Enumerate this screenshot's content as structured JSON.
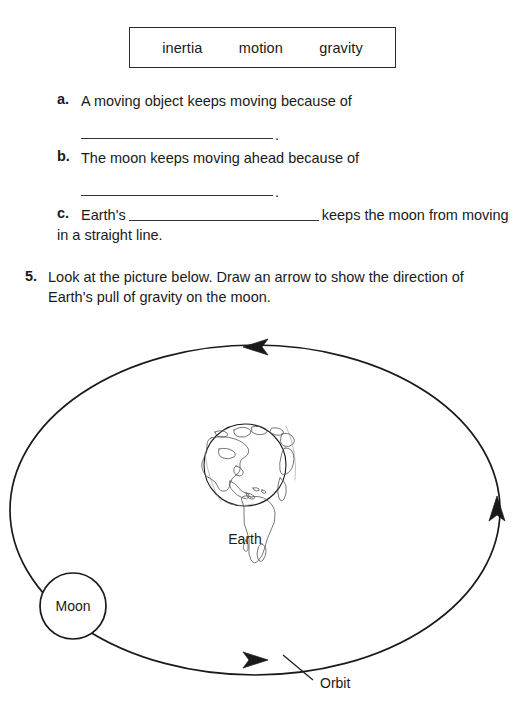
{
  "worksheet": {
    "word_bank": {
      "words": [
        "inertia",
        "motion",
        "gravity"
      ]
    },
    "fill_in_items": [
      {
        "marker": "a.",
        "text": "A moving object keeps moving because of",
        "blank_style": "below-line",
        "period": "."
      },
      {
        "marker": "b.",
        "text": "The moon keeps moving ahead because of",
        "blank_style": "below-line",
        "period": "."
      },
      {
        "marker": "c.",
        "text_before_blank": "Earth's",
        "text_after_blank": "keeps the moon from moving in a straight line.",
        "blank_style": "inline"
      }
    ],
    "question": {
      "number": "5.",
      "text": "Look at the picture below. Draw an arrow to show the direction of Earth's pull of gravity on the moon."
    },
    "diagram": {
      "earth_label": "Earth",
      "moon_label": "Moon",
      "orbit_label": "Orbit",
      "stroke_color": "#1a1a1a",
      "fill_color": "#ffffff",
      "orbit": {
        "center_x": 255,
        "center_y": 192,
        "radius_x": 245,
        "radius_y": 165,
        "direction": "counterclockwise",
        "arrow_count": 3
      },
      "earth": {
        "center_x": 245,
        "center_y": 147,
        "radius": 41
      },
      "moon": {
        "center_x": 73,
        "center_y": 288,
        "radius": 33
      }
    }
  }
}
